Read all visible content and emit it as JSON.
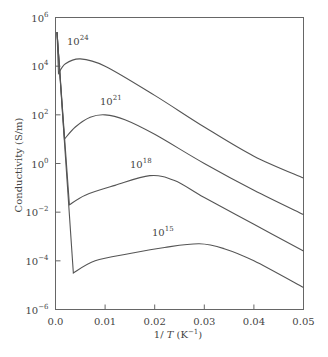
{
  "chart_data": {
    "type": "line",
    "title": "",
    "xlabel": "1/T (K^-1)",
    "ylabel": "Conductivity (S/m)",
    "xscale": "linear",
    "yscale": "log",
    "xlim": [
      0.0,
      0.05
    ],
    "ylim": [
      1e-06,
      1000000.0
    ],
    "grid": false,
    "legend": "inline labels",
    "x_ticks": [
      "0.0",
      "0.01",
      "0.02",
      "0.03",
      "0.04",
      "0.05"
    ],
    "y_ticks": [
      {
        "base": "10",
        "exp": "6"
      },
      {
        "base": "10",
        "exp": "4"
      },
      {
        "base": "10",
        "exp": "2"
      },
      {
        "base": "10",
        "exp": "0"
      },
      {
        "base": "10",
        "exp": "−2"
      },
      {
        "base": "10",
        "exp": "−4"
      },
      {
        "base": "10",
        "exp": "−6"
      }
    ],
    "series": [
      {
        "name": "10^24",
        "label_base": "10",
        "label_exp": "24",
        "points_log10": [
          [
            0.0003,
            5.4
          ],
          [
            0.0006,
            3.7
          ],
          [
            0.002,
            4.1
          ],
          [
            0.005,
            4.3
          ],
          [
            0.01,
            4.0
          ],
          [
            0.02,
            2.8
          ],
          [
            0.03,
            1.5
          ],
          [
            0.04,
            0.3
          ],
          [
            0.05,
            -0.6
          ]
        ]
      },
      {
        "name": "10^21",
        "label_base": "10",
        "label_exp": "21",
        "points_log10": [
          [
            0.0003,
            5.4
          ],
          [
            0.0018,
            1.0
          ],
          [
            0.004,
            1.5
          ],
          [
            0.007,
            1.9
          ],
          [
            0.01,
            2.0
          ],
          [
            0.014,
            1.8
          ],
          [
            0.02,
            1.2
          ],
          [
            0.03,
            0.0
          ],
          [
            0.04,
            -1.1
          ],
          [
            0.05,
            -2.1
          ]
        ]
      },
      {
        "name": "10^18",
        "label_base": "10",
        "label_exp": "18",
        "points_log10": [
          [
            0.0003,
            5.4
          ],
          [
            0.0028,
            -1.7
          ],
          [
            0.006,
            -1.3
          ],
          [
            0.012,
            -0.9
          ],
          [
            0.019,
            -0.5
          ],
          [
            0.024,
            -0.7
          ],
          [
            0.03,
            -1.4
          ],
          [
            0.04,
            -2.5
          ],
          [
            0.05,
            -3.6
          ]
        ]
      },
      {
        "name": "10^15",
        "label_base": "10",
        "label_exp": "15",
        "points_log10": [
          [
            0.0003,
            5.4
          ],
          [
            0.0036,
            -4.5
          ],
          [
            0.008,
            -4.0
          ],
          [
            0.015,
            -3.7
          ],
          [
            0.022,
            -3.45
          ],
          [
            0.029,
            -3.3
          ],
          [
            0.034,
            -3.5
          ],
          [
            0.04,
            -4.0
          ],
          [
            0.05,
            -5.1
          ]
        ]
      }
    ]
  }
}
